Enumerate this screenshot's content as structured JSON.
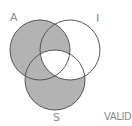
{
  "diagram": {
    "type": "venn-3",
    "circles": [
      {
        "id": "A",
        "label": "A",
        "cx": 40,
        "cy": 50,
        "r": 30
      },
      {
        "id": "I",
        "label": "I",
        "cx": 70,
        "cy": 50,
        "r": 30
      },
      {
        "id": "S",
        "label": "S",
        "cx": 55,
        "cy": 80,
        "r": 30
      }
    ],
    "shaded_regions": [
      "A only",
      "A∩I only",
      "A∩S only",
      "S only"
    ],
    "unshaded_regions": [
      "I only",
      "I∩S only",
      "A∩I∩S"
    ],
    "verdict": "VALID",
    "colors": {
      "shade": "#b3b3b3",
      "outline": "#555555",
      "label": "#8a8a8a",
      "background": "#ffffff"
    }
  },
  "labels": {
    "a": "A",
    "i": "I",
    "s": "S",
    "verdict": "VALID"
  }
}
